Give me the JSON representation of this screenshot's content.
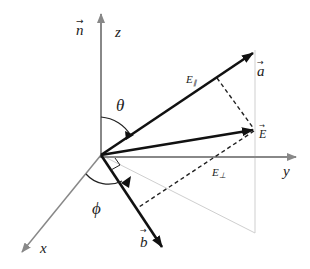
{
  "diagram": {
    "title": "",
    "axes": {
      "z": {
        "label": "z"
      },
      "y": {
        "label": "y"
      },
      "x": {
        "label": "x"
      },
      "n": {
        "label": "n",
        "arrow": "→"
      }
    },
    "vectors": {
      "a": {
        "label": "a",
        "arrow": "→"
      },
      "E": {
        "label": "E",
        "arrow": "→"
      },
      "b": {
        "label": "b",
        "arrow": "→"
      }
    },
    "components": {
      "parallel": {
        "label": "E",
        "subscript": "∥"
      },
      "perpendicular": {
        "label": "E",
        "subscript": "⊥"
      }
    },
    "angles": {
      "theta": {
        "label": "θ"
      },
      "phi": {
        "label": "ϕ"
      }
    },
    "colors": {
      "axis": "#888888",
      "vector": "#111111",
      "dashed": "#222222",
      "guide": "#cccccc"
    }
  }
}
